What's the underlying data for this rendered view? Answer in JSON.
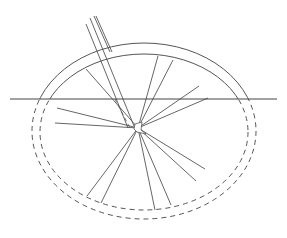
{
  "diagram": {
    "stroke_color": "#555555",
    "background": "#ffffff",
    "horizon_line": {
      "x1": 10,
      "y1": 99,
      "x2": 277,
      "y2": 99
    },
    "outer_rim": {
      "cx": 144,
      "cy": 131,
      "rx": 112,
      "ry": 88
    },
    "inner_rim": {
      "cx": 144,
      "cy": 132,
      "rx": 104,
      "ry": 78
    },
    "hub": {
      "x": 138,
      "y": 128
    },
    "spokes_above": [
      {
        "x": 86,
        "y": 69
      },
      {
        "x": 158,
        "y": 56
      },
      {
        "x": 173,
        "y": 60
      },
      {
        "x": 199,
        "y": 86
      },
      {
        "x": 208,
        "y": 98
      }
    ],
    "spokes_below": [
      {
        "x": 57,
        "y": 108
      },
      {
        "x": 55,
        "y": 123
      },
      {
        "x": 87,
        "y": 196
      },
      {
        "x": 101,
        "y": 203
      },
      {
        "x": 155,
        "y": 210
      },
      {
        "x": 171,
        "y": 205
      },
      {
        "x": 196,
        "y": 181
      },
      {
        "x": 205,
        "y": 169
      }
    ],
    "rod": {
      "lines": [
        {
          "x1": 86,
          "y1": 24,
          "x2": 128,
          "y2": 128
        },
        {
          "x1": 90,
          "y1": 18,
          "x2": 134,
          "y2": 126
        },
        {
          "x1": 94,
          "y1": 16,
          "x2": 110,
          "y2": 52
        },
        {
          "x1": 96,
          "y1": 16,
          "x2": 112,
          "y2": 52
        }
      ]
    }
  }
}
